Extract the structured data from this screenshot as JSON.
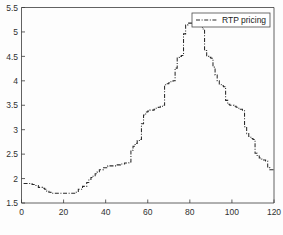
{
  "chart_data": {
    "type": "line",
    "title": "",
    "xlabel": "",
    "ylabel": "",
    "xlim": [
      0,
      120
    ],
    "ylim": [
      1.5,
      5.5
    ],
    "xticks": [
      0,
      20,
      40,
      60,
      80,
      100,
      120
    ],
    "yticks": [
      1.5,
      2,
      2.5,
      3,
      3.5,
      4,
      4.5,
      5,
      5.5
    ],
    "xtick_labels": [
      "0",
      "20",
      "40",
      "60",
      "80",
      "100",
      "120"
    ],
    "ytick_labels": [
      "1.5",
      "2",
      "2.5",
      "3",
      "3.5",
      "4",
      "4.5",
      "5",
      "5.5"
    ],
    "grid": false,
    "legend": {
      "position": "top-right",
      "entries": [
        {
          "label": "RTP pricing",
          "linestyle": "dash-dot",
          "color": "#2a2a2a"
        }
      ]
    },
    "line_color": "#2a2a2a",
    "line_style": "dash-dot",
    "series": [
      {
        "name": "RTP pricing",
        "x": [
          1,
          2,
          3,
          4,
          5,
          6,
          7,
          8,
          9,
          10,
          11,
          12,
          13,
          14,
          15,
          16,
          17,
          18,
          19,
          20,
          21,
          22,
          23,
          24,
          25,
          26,
          27,
          28,
          29,
          30,
          31,
          32,
          33,
          34,
          35,
          36,
          37,
          38,
          39,
          40,
          41,
          42,
          43,
          44,
          45,
          46,
          47,
          48,
          49,
          50,
          51,
          52,
          53,
          54,
          55,
          56,
          57,
          58,
          59,
          60,
          61,
          62,
          63,
          64,
          65,
          66,
          67,
          68,
          69,
          70,
          71,
          72,
          73,
          74,
          75,
          76,
          77,
          78,
          79,
          80,
          81,
          82,
          83,
          84,
          85,
          86,
          87,
          88,
          89,
          90,
          91,
          92,
          93,
          94,
          95,
          96,
          97,
          98,
          99,
          100,
          101,
          102,
          103,
          104,
          105,
          106,
          107,
          108,
          109,
          110,
          111,
          112,
          113,
          114,
          115,
          116,
          117,
          118,
          119,
          120
        ],
        "values": [
          1.9,
          1.9,
          1.9,
          1.9,
          1.88,
          1.86,
          1.86,
          1.82,
          1.82,
          1.8,
          1.78,
          1.74,
          1.72,
          1.7,
          1.7,
          1.7,
          1.7,
          1.7,
          1.7,
          1.7,
          1.7,
          1.7,
          1.7,
          1.7,
          1.7,
          1.72,
          1.78,
          1.78,
          1.84,
          1.84,
          1.92,
          1.98,
          2.02,
          2.06,
          2.1,
          2.14,
          2.18,
          2.18,
          2.22,
          2.22,
          2.26,
          2.26,
          2.26,
          2.26,
          2.28,
          2.28,
          2.3,
          2.3,
          2.32,
          2.32,
          2.34,
          2.58,
          2.66,
          2.72,
          2.78,
          2.8,
          3.12,
          3.3,
          3.36,
          3.38,
          3.4,
          3.4,
          3.42,
          3.44,
          3.46,
          3.48,
          3.5,
          3.92,
          3.94,
          3.96,
          3.98,
          4.0,
          4.26,
          4.48,
          4.5,
          4.52,
          4.96,
          5.14,
          5.18,
          5.18,
          5.2,
          5.24,
          5.26,
          5.28,
          5.28,
          5.06,
          4.62,
          4.5,
          4.48,
          4.46,
          4.28,
          4.12,
          4.0,
          3.92,
          3.9,
          3.88,
          3.6,
          3.52,
          3.5,
          3.5,
          3.48,
          3.46,
          3.44,
          3.42,
          3.4,
          3.06,
          2.92,
          2.86,
          2.82,
          2.8,
          2.52,
          2.46,
          2.42,
          2.4,
          2.38,
          2.36,
          2.22,
          2.18,
          2.18,
          2.18
        ]
      }
    ]
  },
  "figure": {
    "background": "#fdfdfd",
    "axis_color": "#3a3a3a"
  }
}
